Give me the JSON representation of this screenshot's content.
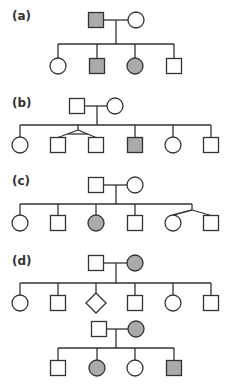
{
  "colors": {
    "line": "#333333",
    "affected": "#aaaaaa",
    "unaffected": "#ffffff"
  },
  "panels": [
    {
      "label": "(a)",
      "label_pos": [
        12,
        9
      ],
      "parents": {
        "father": {
          "shape": "square",
          "x": 96,
          "y": 20,
          "affected": true
        },
        "mother": {
          "shape": "circle",
          "x": 136,
          "y": 20,
          "affected": false
        },
        "drop_x": 116
      },
      "sibship_y": 44,
      "children_y": 66,
      "children": [
        {
          "shape": "circle",
          "x": 58,
          "affected": false
        },
        {
          "shape": "square",
          "x": 97,
          "affected": true
        },
        {
          "shape": "circle",
          "x": 135,
          "affected": true
        },
        {
          "shape": "square",
          "x": 174,
          "affected": false
        }
      ]
    },
    {
      "label": "(b)",
      "label_pos": [
        12,
        96
      ],
      "parents": {
        "father": {
          "shape": "square",
          "x": 77,
          "y": 106,
          "affected": false
        },
        "mother": {
          "shape": "circle",
          "x": 115,
          "y": 106,
          "affected": false
        },
        "drop_x": 97
      },
      "sibship_y": 125,
      "children_y": 145,
      "children": [
        {
          "shape": "circle",
          "x": 20,
          "affected": false
        },
        {
          "shape": "square",
          "x": 58,
          "affected": false,
          "twin_group": 1
        },
        {
          "shape": "square",
          "x": 96,
          "affected": false,
          "twin_group": 1
        },
        {
          "shape": "square",
          "x": 135,
          "affected": true
        },
        {
          "shape": "circle",
          "x": 173,
          "affected": false
        },
        {
          "shape": "square",
          "x": 211,
          "affected": false
        }
      ],
      "twins": [
        {
          "apex_x": 78,
          "apex_y": 130,
          "type": "monozygotic"
        }
      ]
    },
    {
      "label": "(c)",
      "label_pos": [
        12,
        174
      ],
      "parents": {
        "father": {
          "shape": "square",
          "x": 96,
          "y": 185,
          "affected": false
        },
        "mother": {
          "shape": "circle",
          "x": 135,
          "y": 185,
          "affected": false
        },
        "drop_x": 116
      },
      "sibship_y": 204,
      "children_y": 223,
      "children": [
        {
          "shape": "circle",
          "x": 20,
          "affected": false
        },
        {
          "shape": "square",
          "x": 58,
          "affected": false
        },
        {
          "shape": "circle",
          "x": 96,
          "affected": true
        },
        {
          "shape": "square",
          "x": 135,
          "affected": false
        },
        {
          "shape": "circle",
          "x": 173,
          "affected": false,
          "twin_group": 1
        },
        {
          "shape": "square",
          "x": 211,
          "affected": false,
          "twin_group": 1
        }
      ],
      "twins": [
        {
          "apex_x": 192,
          "apex_y": 210,
          "type": "dizygotic"
        }
      ]
    },
    {
      "label": "(d)",
      "label_pos": [
        12,
        254
      ],
      "parents": {
        "father": {
          "shape": "square",
          "x": 96,
          "y": 263,
          "affected": false
        },
        "mother": {
          "shape": "circle",
          "x": 135,
          "y": 263,
          "affected": true
        },
        "drop_x": 116
      },
      "sibship_y": 283,
      "children_y": 303,
      "children": [
        {
          "shape": "circle",
          "x": 20,
          "affected": false
        },
        {
          "shape": "square",
          "x": 58,
          "affected": false
        },
        {
          "shape": "diamond",
          "x": 96,
          "affected": false
        },
        {
          "shape": "square",
          "x": 135,
          "affected": false
        },
        {
          "shape": "circle",
          "x": 173,
          "affected": false
        },
        {
          "shape": "square",
          "x": 211,
          "affected": false
        }
      ]
    },
    {
      "label": "",
      "parents": {
        "father": {
          "shape": "square",
          "x": 99,
          "y": 329,
          "affected": false
        },
        "mother": {
          "shape": "circle",
          "x": 136,
          "y": 329,
          "affected": true
        },
        "drop_x": 116
      },
      "sibship_y": 348,
      "children_y": 368,
      "children": [
        {
          "shape": "square",
          "x": 58,
          "affected": false
        },
        {
          "shape": "circle",
          "x": 97,
          "affected": true
        },
        {
          "shape": "circle",
          "x": 135,
          "affected": false
        },
        {
          "shape": "square",
          "x": 174,
          "affected": true
        }
      ]
    }
  ]
}
